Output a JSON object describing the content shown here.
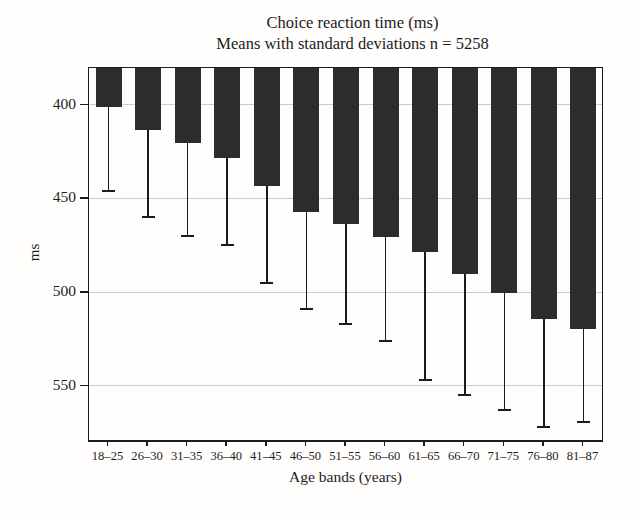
{
  "figure": {
    "title_line1": "Choice reaction time (ms)",
    "title_line2": "Means with standard deviations n = 5258"
  },
  "chart_data": {
    "type": "bar",
    "title": "Choice reaction time (ms)",
    "subtitle": "Means with standard deviations n = 5258",
    "xlabel": "Age bands (years)",
    "ylabel": "ms",
    "categories": [
      "18–25",
      "26–30",
      "31–35",
      "36–40",
      "41–45",
      "46–50",
      "51–55",
      "56–60",
      "61–65",
      "66–70",
      "71–75",
      "76–80",
      "81–87"
    ],
    "series": [
      {
        "name": "Mean choice reaction time (ms)",
        "values": [
          401,
          413,
          420,
          428,
          443,
          457,
          463,
          470,
          478,
          490,
          500,
          514,
          519
        ]
      },
      {
        "name": "Standard deviation (ms)",
        "values": [
          44,
          46,
          49,
          46,
          51,
          51,
          53,
          55,
          68,
          64,
          62,
          57,
          49
        ]
      }
    ],
    "error_bar_tips": [
      445,
      459,
      469,
      474,
      494,
      508,
      516,
      525,
      546,
      554,
      562,
      571,
      568
    ],
    "y_ticks": [
      400,
      450,
      500,
      550
    ],
    "ylim": [
      380,
      580
    ],
    "y_axis_inverted": true,
    "error_bars": "one standard deviation drawn downward from bar end with end cap",
    "grid": "horizontal gridlines at labeled y ticks",
    "legend": "none",
    "bar_color": "#2d2b2c",
    "background_color": "#fffefd",
    "gridline_color": "#cccbc8"
  }
}
